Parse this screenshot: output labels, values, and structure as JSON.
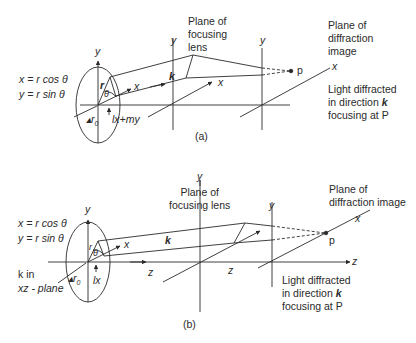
{
  "figure": {
    "panel_a": {
      "caption": "(a)",
      "eq_x": "x = r cos θ",
      "eq_y": "y = r sin θ",
      "axis_y": "y",
      "vec_r": "r",
      "angle": "θ",
      "axis_x_local": "x",
      "r0": "r",
      "r0_sub": "0",
      "phase": "lx+my",
      "k": "k",
      "lens_y": "y",
      "lens_x": "x",
      "lens_label": [
        "Plane of",
        "focusing",
        "lens"
      ],
      "image_y": "y",
      "image_x": "x",
      "point": "p",
      "image_label": [
        "Plane of",
        "diffraction",
        "image"
      ],
      "note": [
        "Light diffracted",
        "in direction ",
        "focusing at P"
      ],
      "note_k": "k"
    },
    "panel_b": {
      "caption": "(b)",
      "eq_x": "x = r cos θ",
      "eq_y": "y = r sin θ",
      "k_in_1": "k in",
      "k_in_2": "xz - plane",
      "axis_y": "y",
      "vec_r": "r",
      "angle": "θ",
      "axis_x_local": "x",
      "r0": "r",
      "r0_sub": "0",
      "phase": "lx",
      "k": "k",
      "axis_z": "z",
      "lens_y": "y",
      "lens_z": "z",
      "lens_label": [
        "Plane of",
        "focusing lens"
      ],
      "image_y": "y",
      "image_x": "x",
      "image_z": "z",
      "point": "p",
      "image_label": [
        "Plane of",
        "diffraction image"
      ],
      "note": [
        "Light diffracted",
        "in direction ",
        "focusing at P"
      ],
      "note_k": "k"
    }
  },
  "colors": {
    "ink": "#2a2a2a",
    "background": "#ffffff"
  }
}
